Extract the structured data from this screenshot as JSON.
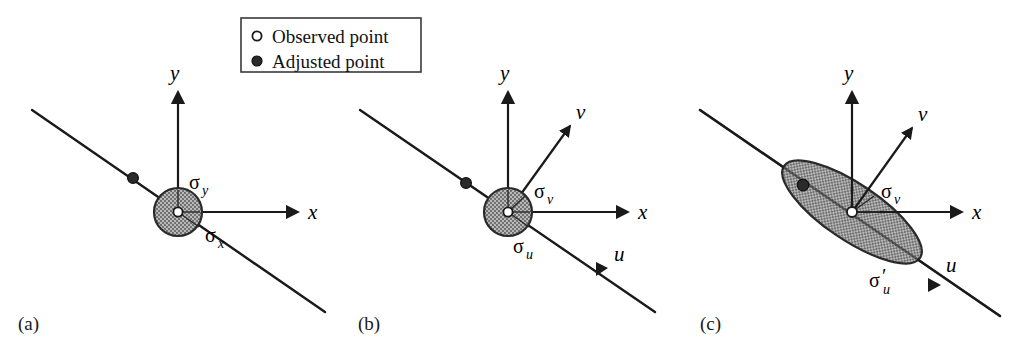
{
  "figure": {
    "background_color": "#ffffff",
    "ink_color": "#1a1a1a",
    "ellipse_fill_color": "#a9a9a9",
    "ellipse_stroke_color": "#2a2a2a"
  },
  "legend": {
    "items": [
      {
        "marker": "open-circle",
        "label": "Observed point"
      },
      {
        "marker": "filled-circle",
        "label": "Adjusted point"
      }
    ]
  },
  "panels": [
    {
      "id": "a",
      "caption": "(a)",
      "axes": [
        {
          "name": "y",
          "label": "y",
          "direction": "up"
        },
        {
          "name": "x",
          "label": "x",
          "direction": "right"
        }
      ],
      "sigma_labels": [
        {
          "name": "sigma-y",
          "symbol": "σ",
          "subscript": "y",
          "prime": false
        },
        {
          "name": "sigma-x",
          "symbol": "σ",
          "subscript": "x",
          "prime": false
        }
      ],
      "ellipse": {
        "shape": "circle",
        "semi_major": 24,
        "semi_minor": 24,
        "rotation_deg": 0
      },
      "points": [
        {
          "type": "observed",
          "marker": "open-circle"
        },
        {
          "type": "adjusted",
          "marker": "filled-circle"
        }
      ]
    },
    {
      "id": "b",
      "caption": "(b)",
      "axes": [
        {
          "name": "y",
          "label": "y",
          "direction": "up"
        },
        {
          "name": "x",
          "label": "x",
          "direction": "right"
        },
        {
          "name": "v",
          "label": "v",
          "direction": "up-right"
        },
        {
          "name": "u",
          "label": "u",
          "direction": "down-right"
        }
      ],
      "sigma_labels": [
        {
          "name": "sigma-v",
          "symbol": "σ",
          "subscript": "v",
          "prime": false
        },
        {
          "name": "sigma-u",
          "symbol": "σ",
          "subscript": "u",
          "prime": false
        }
      ],
      "ellipse": {
        "shape": "circle",
        "semi_major": 24,
        "semi_minor": 24,
        "rotation_deg": 0
      },
      "points": [
        {
          "type": "observed",
          "marker": "open-circle"
        },
        {
          "type": "adjusted",
          "marker": "filled-circle"
        }
      ]
    },
    {
      "id": "c",
      "caption": "(c)",
      "axes": [
        {
          "name": "y",
          "label": "y",
          "direction": "up"
        },
        {
          "name": "x",
          "label": "x",
          "direction": "right"
        },
        {
          "name": "v",
          "label": "v",
          "direction": "up-right"
        },
        {
          "name": "u",
          "label": "u",
          "direction": "down-right"
        }
      ],
      "sigma_labels": [
        {
          "name": "sigma-v",
          "symbol": "σ",
          "subscript": "v",
          "prime": false
        },
        {
          "name": "sigma-u-prime",
          "symbol": "σ",
          "subscript": "u",
          "prime": true
        }
      ],
      "ellipse": {
        "shape": "ellipse",
        "semi_major": 82,
        "semi_minor": 28,
        "rotation_deg": 34
      },
      "points": [
        {
          "type": "observed",
          "marker": "open-circle"
        },
        {
          "type": "adjusted",
          "marker": "filled-circle"
        }
      ]
    }
  ]
}
